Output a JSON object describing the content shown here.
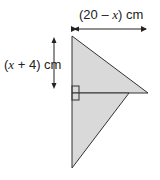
{
  "diagram": {
    "type": "geometry-figure",
    "shape": "two right-angled triangles sharing a vertical side",
    "labels": {
      "width": {
        "open": "(20 – ",
        "var": "x",
        "close": ") cm"
      },
      "height": {
        "open": "(",
        "var": "x",
        "close": " + 4) cm"
      }
    },
    "colors": {
      "fill": "#d9d9d9",
      "stroke": "#333333",
      "arrow": "#222222"
    }
  }
}
